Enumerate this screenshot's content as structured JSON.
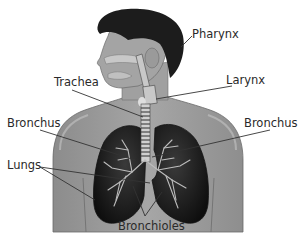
{
  "diagram": {
    "colors": {
      "background": "#ffffff",
      "skin": "#9a9a9a",
      "skin_light": "#b8b8b8",
      "hair": "#1c1c1c",
      "lung": "#1a1a1a",
      "airway": "#c8c8c8",
      "leader_line": "#333333",
      "label_text": "#2a2a2a"
    },
    "labels": [
      {
        "id": "pharynx",
        "text": "Pharynx",
        "x": 192,
        "y": 38,
        "line": [
          [
            192,
            36
          ],
          [
            181,
            47
          ]
        ]
      },
      {
        "id": "larynx",
        "text": "Larynx",
        "x": 226,
        "y": 84,
        "line": [
          [
            232,
            86
          ],
          [
            156,
            99
          ]
        ]
      },
      {
        "id": "trachea",
        "text": "Trachea",
        "x": 54,
        "y": 86,
        "line": [
          [
            72,
            90
          ],
          [
            143,
            117
          ]
        ]
      },
      {
        "id": "bronchus-left",
        "text": "Bronchus",
        "x": 7,
        "y": 127,
        "line": [
          [
            40,
            130
          ],
          [
            135,
            160
          ]
        ]
      },
      {
        "id": "bronchus-right",
        "text": "Bronchus",
        "x": 244,
        "y": 127,
        "line": [
          [
            270,
            130
          ],
          [
            152,
            157
          ]
        ]
      },
      {
        "id": "lungs",
        "text": "Lungs",
        "x": 7,
        "y": 169,
        "lines": [
          [
            [
              40,
              167
            ],
            [
              150,
              183
            ]
          ],
          [
            [
              40,
              167
            ],
            [
              95,
              200
            ]
          ]
        ]
      },
      {
        "id": "bronchioles",
        "text": "Bronchioles",
        "x": 118,
        "y": 230,
        "lines": [
          [
            [
              145,
              218
            ],
            [
              133,
              186
            ]
          ],
          [
            [
              145,
              218
            ],
            [
              162,
              192
            ]
          ],
          [
            [
              145,
              218
            ],
            [
              118,
              198
            ]
          ]
        ]
      }
    ]
  }
}
